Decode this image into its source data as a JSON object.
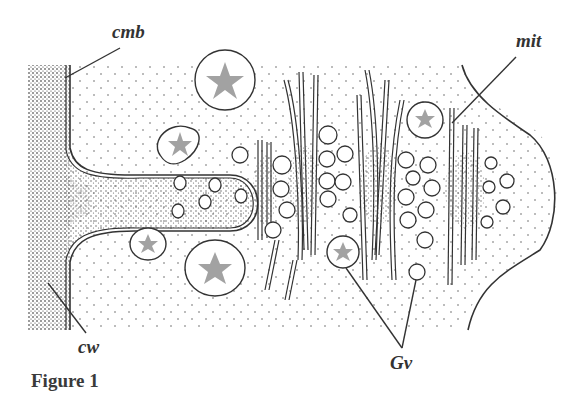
{
  "figure": {
    "caption": "Figure 1",
    "labels": {
      "cmb": "cmb",
      "cw": "cw",
      "mit": "mit",
      "gv": "Gv"
    },
    "colors": {
      "ink": "#333333",
      "stipple": "#555555",
      "background": "#ffffff"
    }
  }
}
